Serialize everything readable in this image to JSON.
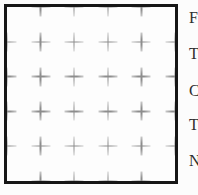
{
  "figure": {
    "name": "calibration-grid-square",
    "background_color": "#fdfdfd",
    "border_color": "#161616",
    "cross_color": "#8d8d8d",
    "grid": {
      "rows": 6,
      "cols": 6,
      "corner_marks": false,
      "mark": "plus-cross",
      "edge_marks_clipped_by_border": true
    }
  },
  "text_lines": [
    "F",
    "T",
    "C",
    "T",
    "N"
  ]
}
